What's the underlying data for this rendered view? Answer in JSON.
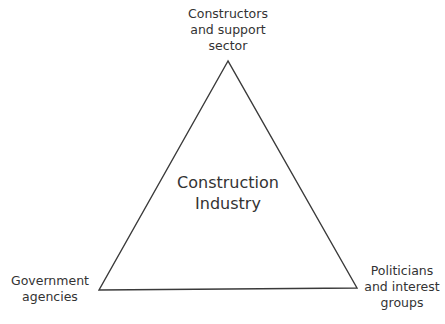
{
  "diagram": {
    "type": "triangle",
    "center": {
      "lines": [
        "Construction",
        "Industry"
      ]
    },
    "vertices": {
      "top": {
        "lines": [
          "Constructors",
          "and support",
          "sector"
        ]
      },
      "bottom_left": {
        "lines": [
          "Government",
          "agencies"
        ]
      },
      "bottom_right": {
        "lines": [
          "Politicians",
          "and interest",
          "groups"
        ]
      }
    },
    "colors": {
      "stroke": "#3a3a3a",
      "text": "#333333",
      "background": "#ffffff"
    }
  }
}
